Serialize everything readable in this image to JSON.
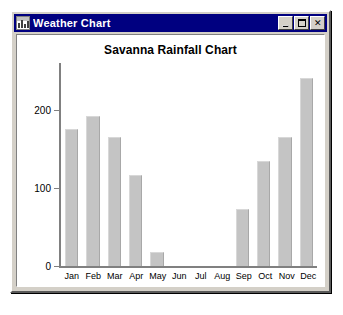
{
  "window": {
    "title": "Weather Chart",
    "icon": "chart-app-icon",
    "controls": {
      "minimize_label": "_",
      "maximize_label": "□",
      "close_label": "✕"
    },
    "colors": {
      "titlebar": "#000080",
      "frame": "#d4d0c8",
      "client": "#ffffff"
    }
  },
  "chart_data": {
    "type": "bar",
    "title": "Savanna Rainfall Chart",
    "xlabel": "",
    "ylabel": "",
    "categories": [
      "Jan",
      "Feb",
      "Mar",
      "Apr",
      "May",
      "Jun",
      "Jul",
      "Aug",
      "Sep",
      "Oct",
      "Nov",
      "Dec"
    ],
    "values": [
      175,
      192,
      165,
      117,
      18,
      0,
      0,
      0,
      73,
      135,
      165,
      241
    ],
    "ylim": [
      0,
      260
    ],
    "yticks": [
      0,
      100,
      200
    ],
    "ytick_labels": [
      "0",
      "100",
      "200"
    ],
    "grid": false,
    "legend": false,
    "bar_color": "#c4c4c4",
    "axis_color": "#808080"
  }
}
